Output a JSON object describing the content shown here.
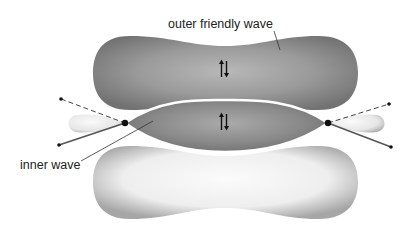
{
  "labels": {
    "outer": "outer friendly wave",
    "inner": "inner wave"
  },
  "spin_symbols": {
    "outer": "spin-pair-up-down",
    "inner": "spin-pair-up-down"
  },
  "colors": {
    "dark_lobe": "#7a7a7a",
    "dark_lobe_highlight": "#b8b8b8",
    "light_lobe": "#f4f4f4",
    "light_lobe_edge": "#a8a8a8",
    "line": "#444444",
    "dot": "#111111",
    "background": "#ffffff"
  }
}
